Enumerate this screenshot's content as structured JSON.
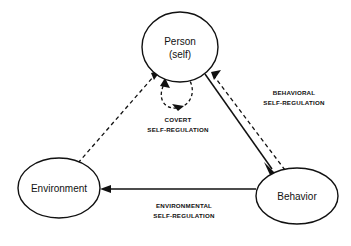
{
  "diagram": {
    "background_color": "#ffffff",
    "line_color": "#111111",
    "nodes": [
      {
        "id": "person",
        "label_line1": "Person",
        "label_line2": "(self)",
        "shape": "ellipse",
        "cx": 180,
        "cy": 47,
        "rx": 38,
        "ry": 35
      },
      {
        "id": "environment",
        "label_line1": "Environment",
        "label_line2": "",
        "shape": "ellipse",
        "cx": 59,
        "cy": 188,
        "rx": 41,
        "ry": 30
      },
      {
        "id": "behavior",
        "label_line1": "Behavior",
        "label_line2": "",
        "shape": "ellipse",
        "cx": 297,
        "cy": 196,
        "rx": 41,
        "ry": 28
      }
    ],
    "edges": [
      {
        "id": "covert",
        "label_line1": "COVERT",
        "label_line2": "SELF-REGULATION",
        "style": "dashed",
        "from": "person",
        "to": "person",
        "kind": "self-loop",
        "label_x": 178,
        "label_y": 120
      },
      {
        "id": "behavioral",
        "label_line1": "BEHAVIORAL",
        "label_line2": "SELF-REGULATION",
        "style": "dashed",
        "from": "behavior",
        "to": "person",
        "kind": "straight",
        "label_x": 294,
        "label_y": 94
      },
      {
        "id": "person-to-behavior",
        "label_line1": "",
        "label_line2": "",
        "style": "solid",
        "from": "person",
        "to": "behavior",
        "kind": "straight"
      },
      {
        "id": "environmental",
        "label_line1": "ENVIRONMENTAL",
        "label_line2": "SELF-REGULATION",
        "style": "solid",
        "from": "behavior",
        "to": "environment",
        "kind": "straight",
        "label_x": 184,
        "label_y": 209
      },
      {
        "id": "environment-to-person",
        "label_line1": "",
        "label_line2": "",
        "style": "dashed",
        "from": "environment",
        "to": "person",
        "kind": "straight"
      }
    ]
  }
}
